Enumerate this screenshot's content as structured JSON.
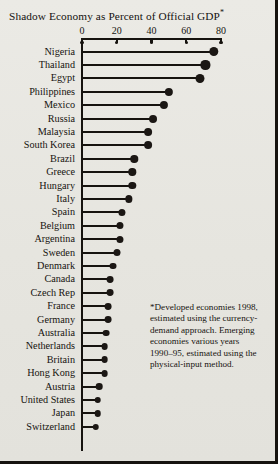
{
  "chart": {
    "title": "Shadow Economy as Percent of Official GDP",
    "title_marker": "*",
    "footnote_lines": [
      "*Developed economies 1998,",
      "estimated using the currency-",
      "demand approach. Emerging",
      "economies various years",
      "1990–95, estimated using the",
      "physical-input method."
    ],
    "footnote_full": "*Developed economies 1998, estimated using the currency-demand approach. Emerging economies various years 1990–95, estimated using the physical-input method."
  },
  "chart_data": {
    "type": "bar",
    "orientation": "horizontal",
    "style": "lollipop",
    "title": "Shadow Economy as Percent of Official GDP*",
    "xlabel": "",
    "ylabel": "",
    "xlim": [
      0,
      80
    ],
    "ticks": [
      0,
      20,
      40,
      60,
      80
    ],
    "grid": false,
    "legend": false,
    "categories": [
      "Nigeria",
      "Thailand",
      "Egypt",
      "Philippines",
      "Mexico",
      "Russia",
      "Malaysia",
      "South Korea",
      "Brazil",
      "Greece",
      "Hungary",
      "Italy",
      "Spain",
      "Belgium",
      "Argentina",
      "Sweden",
      "Denmark",
      "Canada",
      "Czech Rep",
      "France",
      "Germany",
      "Australia",
      "Netherlands",
      "Britain",
      "Hong Kong",
      "Austria",
      "United States",
      "Japan",
      "Switzerland"
    ],
    "values": [
      76,
      71,
      68,
      50,
      47,
      41,
      38,
      38,
      30,
      29,
      29,
      27,
      23,
      22,
      22,
      20,
      18,
      16,
      16,
      15,
      15,
      14,
      13,
      13,
      13,
      10,
      9,
      9,
      8
    ]
  }
}
